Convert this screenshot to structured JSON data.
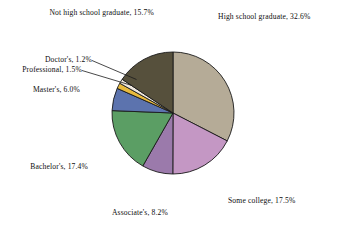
{
  "chart_data": {
    "type": "pie",
    "title": "",
    "subtitle": "",
    "xlabel": "",
    "ylabel": "",
    "legend_position": "none",
    "grid": false,
    "label_format": "{name}, {value}%",
    "start_angle_deg": 0,
    "direction": "clockwise",
    "units": "percent",
    "total": 100.1,
    "categories": [
      "High school graduate",
      "Some college",
      "Associate's",
      "Bachelor's",
      "Master's",
      "Professional",
      "Doctor's",
      "Not high school graduate"
    ],
    "values": [
      32.6,
      17.5,
      8.2,
      17.4,
      6.0,
      1.5,
      1.2,
      15.7
    ],
    "colors": [
      "#b5ab97",
      "#c497c4",
      "#9b7aab",
      "#5b9e64",
      "#5c73ae",
      "#e9ba3d",
      "#efe7dd",
      "#56503c"
    ],
    "slices": [
      {
        "name": "High school graduate",
        "value": 32.6,
        "label": "High school graduate, 32.6%",
        "color": "#b5ab97"
      },
      {
        "name": "Some college",
        "value": 17.5,
        "label": "Some college, 17.5%",
        "color": "#c497c4"
      },
      {
        "name": "Associate's",
        "value": 8.2,
        "label": "Associate's, 8.2%",
        "color": "#9b7aab"
      },
      {
        "name": "Bachelor's",
        "value": 17.4,
        "label": "Bachelor's, 17.4%",
        "color": "#5b9e64"
      },
      {
        "name": "Master's",
        "value": 6.0,
        "label": "Master's, 6.0%",
        "color": "#5c73ae"
      },
      {
        "name": "Professional",
        "value": 1.5,
        "label": "Professional, 1.5%",
        "color": "#e9ba3d"
      },
      {
        "name": "Doctor's",
        "value": 1.2,
        "label": "Doctor's, 1.2%",
        "color": "#efe7dd"
      },
      {
        "name": "Not high school graduate",
        "value": 15.7,
        "label": "Not high school graduate, 15.7%",
        "color": "#56503c"
      }
    ],
    "background_color": "#ffffff",
    "outline_color": "#1a1a1a"
  }
}
